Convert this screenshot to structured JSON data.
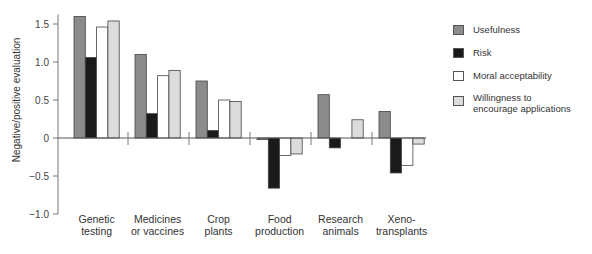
{
  "chart_data": {
    "type": "bar",
    "title": "",
    "xlabel": "",
    "ylabel": "Negative/positive evaluation",
    "ylim": [
      -1.0,
      1.6
    ],
    "yticks": [
      1.5,
      1.0,
      0.5,
      0,
      -0.5,
      -1.0
    ],
    "ytick_labels": [
      "1.5",
      "1.0",
      "0.5",
      "0",
      "−0.5",
      "−1.0"
    ],
    "grid": false,
    "legend_position": "right",
    "categories": [
      "Genetic testing",
      "Medicines or vaccines",
      "Crop plants",
      "Food production",
      "Research animals",
      "Xeno-transplants"
    ],
    "category_lines": [
      [
        "Genetic",
        "testing"
      ],
      [
        "Medicines",
        "or vaccines"
      ],
      [
        "Crop",
        "plants"
      ],
      [
        "Food",
        "production"
      ],
      [
        "Research",
        "animals"
      ],
      [
        "Xeno-",
        "transplants"
      ]
    ],
    "series": [
      {
        "name": "Usefulness",
        "color": "#8c8c8c",
        "values": [
          1.6,
          1.1,
          0.75,
          -0.02,
          0.57,
          0.35
        ]
      },
      {
        "name": "Risk",
        "color": "#1a1a1a",
        "values": [
          1.06,
          0.32,
          0.1,
          -0.66,
          -0.13,
          -0.46
        ]
      },
      {
        "name": "Moral acceptability",
        "color": "#ffffff",
        "values": [
          1.46,
          0.82,
          0.5,
          -0.23,
          0.0,
          -0.36
        ]
      },
      {
        "name": "Willingness to encourage applications",
        "color": "#dcdcdc",
        "values": [
          1.54,
          0.89,
          0.48,
          -0.21,
          0.24,
          -0.08
        ]
      }
    ]
  },
  "legend": {
    "items": [
      {
        "label": "Usefulness",
        "color": "#8c8c8c"
      },
      {
        "label": "Risk",
        "color": "#1a1a1a"
      },
      {
        "label": "Moral acceptability",
        "color": "#ffffff"
      },
      {
        "label": "Willingness to\nencourage applications",
        "color": "#dcdcdc"
      }
    ]
  }
}
